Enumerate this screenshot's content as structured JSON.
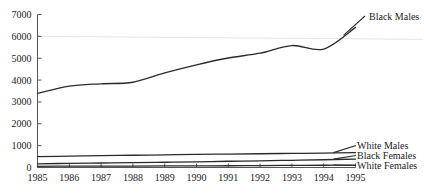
{
  "chart_data": {
    "type": "line",
    "title": "",
    "xlabel": "",
    "ylabel": "",
    "x": [
      1985,
      1986,
      1987,
      1988,
      1989,
      1990,
      1991,
      1992,
      1993,
      1994,
      1995
    ],
    "xlim": [
      1985,
      1995
    ],
    "ylim": [
      0,
      7000
    ],
    "ytick_labels": [
      "0",
      "1000",
      "2000",
      "3000",
      "4000",
      "5000",
      "6000",
      "7000"
    ],
    "ytick_values": [
      0,
      1000,
      2000,
      3000,
      4000,
      5000,
      6000,
      7000
    ],
    "xtick_labels": [
      "1985",
      "1986",
      "1987",
      "1988",
      "1989",
      "1990",
      "1991",
      "1992",
      "1993",
      "1994",
      "1995"
    ],
    "grid": "single horizontal gridline at 6000",
    "legend_position": "right-of-line-ends",
    "series": [
      {
        "name": "Black Males",
        "label": "Black Males",
        "values": [
          3390,
          3720,
          3830,
          3900,
          4330,
          4700,
          5010,
          5230,
          5580,
          5420,
          6410
        ]
      },
      {
        "name": "White Males",
        "label": "White Males",
        "values": [
          500,
          520,
          540,
          560,
          580,
          600,
          615,
          630,
          645,
          660,
          680
        ]
      },
      {
        "name": "Black Females",
        "label": "Black Females",
        "values": [
          170,
          190,
          205,
          220,
          240,
          260,
          285,
          305,
          330,
          355,
          385
        ]
      },
      {
        "name": "White Females",
        "label": "White Females",
        "values": [
          55,
          60,
          62,
          66,
          70,
          75,
          80,
          88,
          95,
          102,
          112
        ]
      }
    ]
  }
}
